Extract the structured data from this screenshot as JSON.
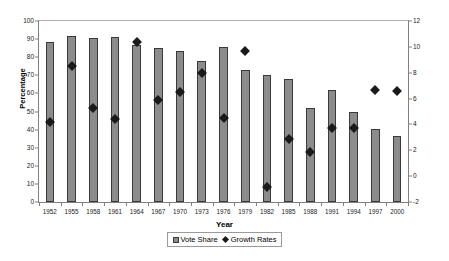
{
  "chart_data": {
    "type": "bar",
    "title": "",
    "xlabel": "Year",
    "ylabel": "Percentage",
    "ylabel_right": "",
    "categories": [
      "1952",
      "1955",
      "1958",
      "1961",
      "1964",
      "1967",
      "1970",
      "1973",
      "1976",
      "1979",
      "1982",
      "1985",
      "1988",
      "1991",
      "1994",
      "1997",
      "2000"
    ],
    "ylim": [
      0,
      100
    ],
    "yticks": [
      0,
      10,
      20,
      30,
      40,
      50,
      60,
      70,
      80,
      90,
      100
    ],
    "ylim_right": [
      -2,
      12
    ],
    "yticks_right": [
      -2,
      0,
      2,
      4,
      6,
      8,
      10,
      12
    ],
    "grid": false,
    "legend_position": "bottom-center",
    "series": [
      {
        "name": "Vote Share",
        "type": "bar",
        "axis": "left",
        "color": "#8c8c8c",
        "values": [
          88.5,
          91.5,
          90.5,
          91.0,
          86.5,
          85.0,
          83.5,
          78.0,
          85.5,
          73.0,
          70.0,
          68.0,
          52.0,
          62.0,
          50.0,
          40.5,
          36.5
        ]
      },
      {
        "name": "Growth Rates",
        "type": "scatter",
        "axis": "right",
        "color": "#1a1a1a",
        "values": [
          4.2,
          8.5,
          5.3,
          4.4,
          10.4,
          5.9,
          6.5,
          8.0,
          4.5,
          9.7,
          -0.8,
          2.9,
          1.9,
          3.7,
          3.7,
          6.7,
          6.6
        ]
      }
    ]
  },
  "legend": {
    "items": [
      {
        "label": "Vote Share",
        "marker": "square"
      },
      {
        "label": "Growth Rates",
        "marker": "diamond"
      }
    ]
  }
}
